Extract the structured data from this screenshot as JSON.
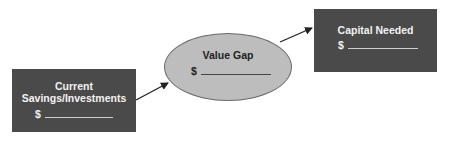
{
  "diagram": {
    "nodes": [
      {
        "id": "current",
        "shape": "rectangle",
        "title_lines": [
          "Current",
          "Savings/Investments"
        ],
        "amount_prefix": "$",
        "fill": "#4a4a4a",
        "text_color": "#f2f2f2"
      },
      {
        "id": "gap",
        "shape": "ellipse",
        "title": "Value Gap",
        "amount_prefix": "$",
        "fill": "#bdbdbd",
        "text_color": "#222222"
      },
      {
        "id": "capital",
        "shape": "rectangle",
        "title": "Capital Needed",
        "amount_prefix": "$",
        "fill": "#4a4a4a",
        "text_color": "#f2f2f2"
      }
    ],
    "edges": [
      {
        "from": "current",
        "to": "gap"
      },
      {
        "from": "gap",
        "to": "capital"
      }
    ]
  }
}
